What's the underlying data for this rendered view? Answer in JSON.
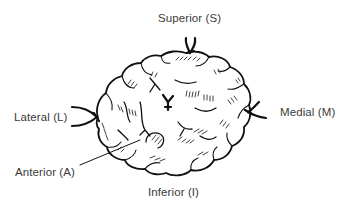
{
  "figure": {
    "labels": {
      "superior": "Superior (S)",
      "lateral": "Lateral (L)",
      "medial": "Medial (M)",
      "anterior": "Anterior (A)",
      "inferior": "Inferior (I)"
    },
    "markers": [
      {
        "id": "superior-suture",
        "position": "top"
      },
      {
        "id": "lateral-suture",
        "position": "left"
      },
      {
        "id": "medial-suture",
        "position": "right"
      },
      {
        "id": "center-suture",
        "position": "center"
      }
    ],
    "colors": {
      "ink": "#111111",
      "label_text": "#3a3a3a",
      "background": "#ffffff"
    }
  }
}
